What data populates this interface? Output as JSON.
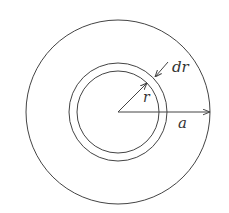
{
  "diagram": {
    "center": {
      "x": 118,
      "y": 112
    },
    "stroke_color": "#444444",
    "background": "#ffffff",
    "circles": [
      {
        "id": "outer",
        "radius": 92
      },
      {
        "id": "ring-outer",
        "radius": 49
      },
      {
        "id": "ring-inner",
        "radius": 41
      }
    ],
    "labels": {
      "dr": "dr",
      "r": "r",
      "a": "a"
    }
  }
}
